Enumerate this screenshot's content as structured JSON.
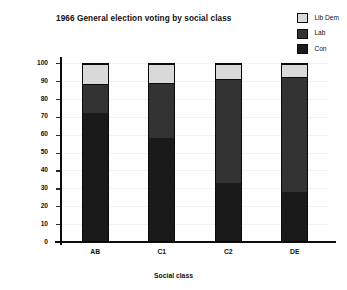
{
  "chart_data": {
    "type": "bar",
    "subtype": "stacked-bar-100",
    "title": "1966 General election voting by social class",
    "xlabel": "Social class",
    "ylabel": "% votes",
    "categories": [
      "AB",
      "C1",
      "C2",
      "DE"
    ],
    "ylim": [
      0,
      100
    ],
    "yticks": [
      0,
      10,
      20,
      30,
      40,
      50,
      60,
      70,
      80,
      90,
      100
    ],
    "ytick_labels": [
      "0",
      "10",
      "20",
      "30",
      "40",
      "50",
      "60",
      "70",
      "80",
      "90",
      "100"
    ],
    "grid": true,
    "legend_position": "top-right",
    "series": [
      {
        "name": "Con",
        "color": "#1a1a1a",
        "values": [
          73,
          59,
          33,
          28
        ]
      },
      {
        "name": "Lab",
        "color": "#333333",
        "values": [
          16,
          31,
          59,
          65
        ]
      },
      {
        "name": "Lib Dem",
        "color": "#d9d9d9",
        "values": [
          11,
          10,
          8,
          7
        ]
      }
    ],
    "stack_order_bottom_to_top": [
      "Con",
      "Lab",
      "Lib Dem"
    ],
    "legend_order_top_to_bottom": [
      "Lib Dem",
      "Lab",
      "Con"
    ]
  },
  "legend": {
    "items": [
      {
        "label": "Lib Dem",
        "color": "#d9d9d9"
      },
      {
        "label": "Lab",
        "color": "#333333"
      },
      {
        "label": "Con",
        "color": "#1a1a1a"
      }
    ]
  },
  "colors": {
    "background": "#ffffff",
    "axis": "#0d0d0d",
    "grid": "#f2f2f2",
    "text": "#111111"
  }
}
